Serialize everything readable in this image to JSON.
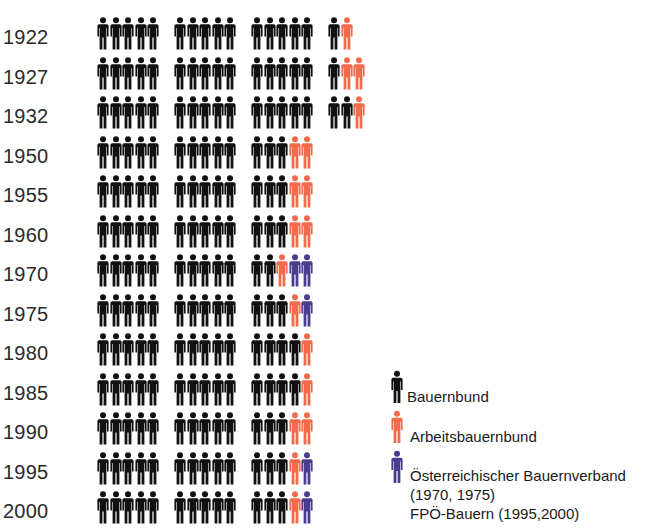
{
  "chart_data": {
    "type": "pictogram",
    "title": "",
    "unit": "seats (1 icon = 1 seat)",
    "categories": [
      "1922",
      "1927",
      "1932",
      "1950",
      "1955",
      "1960",
      "1970",
      "1975",
      "1980",
      "1985",
      "1990",
      "1995",
      "2000"
    ],
    "series": [
      {
        "name": "Bauernbund",
        "color": "#111111",
        "values": [
          16,
          16,
          17,
          13,
          13,
          13,
          12,
          13,
          14,
          14,
          13,
          13,
          13
        ]
      },
      {
        "name": "Arbeitsbauernbund",
        "color": "#F26B4C",
        "values": [
          1,
          2,
          1,
          2,
          2,
          2,
          1,
          1,
          1,
          1,
          2,
          1,
          1
        ]
      },
      {
        "name": "Österreichischer Bauernverband (1970, 1975) / FPÖ-Bauern (1995,2000)",
        "color": "#4A3C8E",
        "values": [
          0,
          0,
          0,
          0,
          0,
          0,
          2,
          1,
          0,
          0,
          0,
          1,
          1
        ]
      }
    ],
    "group_size": 5,
    "legend_position": "bottom-right"
  },
  "rows": [
    {
      "year": "1922"
    },
    {
      "year": "1927"
    },
    {
      "year": "1932"
    },
    {
      "year": "1950"
    },
    {
      "year": "1955"
    },
    {
      "year": "1960"
    },
    {
      "year": "1970"
    },
    {
      "year": "1975"
    },
    {
      "year": "1980"
    },
    {
      "year": "1985"
    },
    {
      "year": "1990"
    },
    {
      "year": "1995"
    },
    {
      "year": "2000"
    }
  ],
  "legend": {
    "items": [
      {
        "label": "Bauernbund",
        "icon": "person-icon",
        "color": "#111111"
      },
      {
        "label": "Arbeitsbauernbund",
        "icon": "person-icon",
        "color": "#F26B4C"
      },
      {
        "label": "Österreichischer Bauernverband",
        "line2": "(1970, 1975)",
        "line3": "FPÖ-Bauern (1995,2000)",
        "icon": "person-icon",
        "color": "#4A3C8E"
      }
    ]
  }
}
